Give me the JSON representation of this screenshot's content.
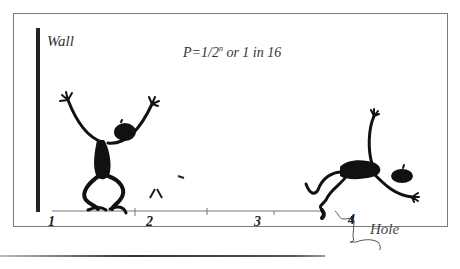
{
  "diagram": {
    "wall_label": "Wall",
    "formula": {
      "prefix": "P=1/2",
      "superscript": "n",
      "suffix": " or 1 in 16"
    },
    "positions": [
      "1",
      "2",
      "3",
      "4"
    ],
    "hole_label": "Hole",
    "figures": [
      {
        "name": "stick-figure-standing",
        "position": "1"
      },
      {
        "name": "stick-figure-falling",
        "position": "4"
      }
    ],
    "colors": {
      "ink": "#111111",
      "frame": "#7a7a7a",
      "text": "#333333"
    }
  }
}
